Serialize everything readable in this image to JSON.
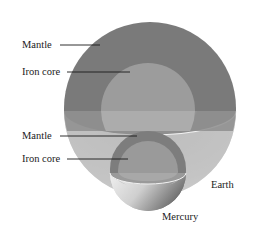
{
  "diagram": {
    "labels": {
      "earth_mantle": "Mantle",
      "earth_core": "Iron core",
      "mercury_mantle": "Mantle",
      "mercury_core": "Iron core",
      "earth": "Earth",
      "mercury": "Mercury"
    },
    "colors": {
      "earth_mantle_upper": "#7a7a7a",
      "earth_core_upper": "#9c9c9c",
      "earth_mantle_cut": "#8f8f8f",
      "earth_core_cut": "#acacac",
      "earth_shell_lower": "#c4c4c4",
      "mercury_mantle": "#7d7d7d",
      "mercury_core": "#9a9a9a",
      "mercury_shell_lower": "#d2d2d2",
      "rim": "#f2f2f2",
      "text": "#222222"
    }
  }
}
